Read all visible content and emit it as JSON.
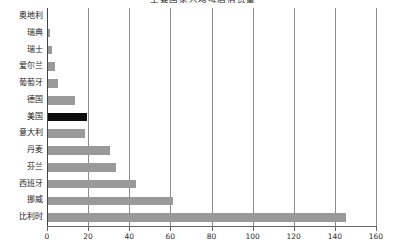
{
  "chart_data": {
    "type": "bar",
    "orientation": "horizontal",
    "title": "主要国家人均啤酒消费量",
    "categories": [
      "奥地利",
      "瑞典",
      "瑞士",
      "爱尔兰",
      "葡萄牙",
      "德国",
      "美国",
      "意大利",
      "丹麦",
      "芬兰",
      "西班牙",
      "挪威",
      "比利时"
    ],
    "values": [
      0,
      1,
      2,
      3.5,
      5,
      13,
      19,
      18,
      30,
      33,
      43,
      61,
      145
    ],
    "xlabel": "",
    "ylabel": "",
    "xlim": [
      0,
      160
    ],
    "xticks": [
      0,
      20,
      40,
      60,
      80,
      100,
      120,
      140,
      160
    ],
    "xticklabels": [
      "0",
      "20",
      "40",
      "60",
      "80",
      "100",
      "120",
      "140",
      "160"
    ],
    "grid": true,
    "grid_axis": "x",
    "legend": false,
    "bar_color": "#9a9a9a",
    "highlight_color": "#0d0d0d",
    "highlight_category": "美国",
    "axis_color": "#666666",
    "background": "#ffffff"
  }
}
